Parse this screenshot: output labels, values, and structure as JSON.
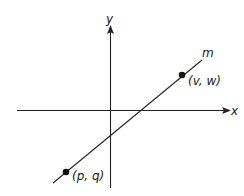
{
  "diagram": {
    "type": "coordinate-plane",
    "axes": {
      "x_label": "x",
      "y_label": "y"
    },
    "line": {
      "label": "m",
      "slope": "positive"
    },
    "points": [
      {
        "label": "(p, q)",
        "position": "lower-left, quadrant III"
      },
      {
        "label": "(v, w)",
        "position": "upper-right, quadrant I"
      }
    ],
    "colors": {
      "ink": "#222222",
      "background": "#ffffff"
    }
  }
}
